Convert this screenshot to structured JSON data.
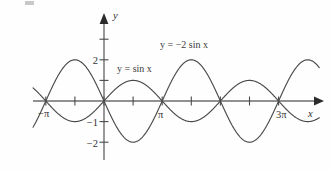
{
  "figure": {
    "x_axis_label": "x",
    "y_axis_label": "y"
  },
  "chart_data": {
    "type": "line",
    "title": "",
    "subtitle": "",
    "xlabel": "x",
    "ylabel": "y",
    "xlim": [
      -3.83,
      11.62
    ],
    "ylim": [
      -2.9,
      3.1
    ],
    "grid": false,
    "legend_position": "inline-annotation",
    "x_tick_labels": [
      "-π",
      "π",
      "3π"
    ],
    "x_tick_values": [
      -3.14159,
      3.14159,
      9.42478
    ],
    "x_tick_all_values": [
      -3.14159,
      -1.5708,
      0,
      1.5708,
      3.14159,
      4.71239,
      6.28319,
      7.85398,
      9.42478
    ],
    "y_tick_labels": [
      "2",
      "-1",
      "-2"
    ],
    "y_tick_values": [
      2,
      -1,
      -2
    ],
    "y_tick_all_values": [
      -2,
      -1,
      1,
      2,
      3
    ],
    "series": [
      {
        "name": "y = sin x",
        "expression": "sin(x)",
        "amplitude": 1,
        "sign": 1,
        "color": "#4a4a4a",
        "annotation": "y = sin x",
        "annotation_x": 1.05,
        "annotation_y": 1.62
      },
      {
        "name": "y = -2 sin x",
        "expression": "-2*sin(x)",
        "amplitude": 2,
        "sign": -1,
        "color": "#4a4a4a",
        "annotation": "y = −2 sin x",
        "annotation_x": 2.95,
        "annotation_y": 2.63
      }
    ],
    "annotations": [
      {
        "text": "y = sin x",
        "x": 1.05,
        "y": 1.62
      },
      {
        "text": "y = −2 sin x",
        "x": 2.95,
        "y": 2.63
      }
    ]
  },
  "labels": {
    "y_axis": "y",
    "x_axis": "x",
    "neg_pi": "−π",
    "pi": "π",
    "three_pi": "3π",
    "two": "2",
    "neg_one": "−1",
    "neg_two": "−2",
    "eq_sin": "y = sin x",
    "eq_neg_two_sin": "y = −2 sin x"
  },
  "colors": {
    "curve": "#4a4a4a",
    "axis": "#6d6d6d",
    "text": "#333333",
    "background": "#fefefe"
  }
}
